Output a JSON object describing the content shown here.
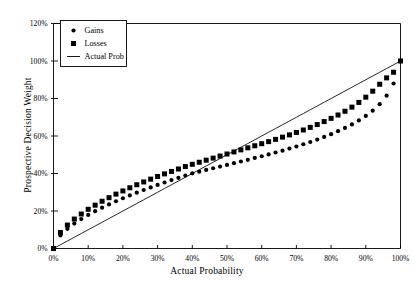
{
  "chart_data": {
    "type": "scatter",
    "title": "",
    "xlabel": "Actual Probability",
    "ylabel": "Prospective Decision Weight",
    "xlim": [
      0,
      100
    ],
    "ylim": [
      0,
      120
    ],
    "grid": false,
    "legend_position": "top-left",
    "xticks": [
      "0%",
      "10%",
      "20%",
      "30%",
      "40%",
      "50%",
      "60%",
      "70%",
      "80%",
      "90%",
      "100%"
    ],
    "xtick_values": [
      0,
      10,
      20,
      30,
      40,
      50,
      60,
      70,
      80,
      90,
      100
    ],
    "yticks": [
      "0%",
      "20%",
      "40%",
      "60%",
      "80%",
      "100%",
      "120%"
    ],
    "ytick_values": [
      0,
      20,
      40,
      60,
      80,
      100,
      120
    ],
    "x": [
      0,
      2,
      4,
      6,
      8,
      10,
      12,
      14,
      16,
      18,
      20,
      22,
      24,
      26,
      28,
      30,
      32,
      34,
      36,
      38,
      40,
      42,
      44,
      46,
      48,
      50,
      52,
      54,
      56,
      58,
      60,
      62,
      64,
      66,
      68,
      70,
      72,
      74,
      76,
      78,
      80,
      82,
      84,
      86,
      88,
      90,
      92,
      94,
      96,
      98,
      100
    ],
    "series": [
      {
        "name": "Gains",
        "marker": "circle",
        "color": "#000000",
        "values": [
          0,
          7.0,
          10.5,
          13.3,
          15.7,
          17.9,
          19.9,
          21.8,
          23.5,
          25.2,
          26.8,
          28.3,
          29.8,
          31.2,
          32.6,
          33.9,
          35.2,
          36.5,
          37.7,
          38.9,
          40.1,
          41.0,
          41.9,
          42.8,
          43.7,
          44.6,
          45.5,
          46.4,
          47.3,
          48.3,
          49.2,
          50.2,
          51.2,
          52.2,
          53.3,
          54.4,
          55.6,
          56.8,
          58.1,
          59.5,
          61.0,
          62.6,
          64.3,
          66.2,
          68.3,
          70.7,
          73.5,
          77.0,
          81.5,
          88.0,
          100
        ]
      },
      {
        "name": "Losses",
        "marker": "square",
        "color": "#000000",
        "values": [
          0,
          8.5,
          12.5,
          15.7,
          18.4,
          20.9,
          23.1,
          25.2,
          27.1,
          29.0,
          30.7,
          32.4,
          34.0,
          35.5,
          37.0,
          38.4,
          39.8,
          41.1,
          42.4,
          43.7,
          44.9,
          46.0,
          47.1,
          48.2,
          49.3,
          50.4,
          51.5,
          52.6,
          53.7,
          54.8,
          55.9,
          57.0,
          58.2,
          59.4,
          60.6,
          61.9,
          63.2,
          64.6,
          66.1,
          67.7,
          69.4,
          71.2,
          73.2,
          75.4,
          77.9,
          80.7,
          83.9,
          87.6,
          91.0,
          94.0,
          100
        ]
      },
      {
        "name": "Actual Prob",
        "marker": "line",
        "color": "#000000",
        "values": [
          0,
          2,
          4,
          6,
          8,
          10,
          12,
          14,
          16,
          18,
          20,
          22,
          24,
          26,
          28,
          30,
          32,
          34,
          36,
          38,
          40,
          42,
          44,
          46,
          48,
          50,
          52,
          54,
          56,
          58,
          60,
          62,
          64,
          66,
          68,
          70,
          72,
          74,
          76,
          78,
          80,
          82,
          84,
          86,
          88,
          90,
          92,
          94,
          96,
          98,
          100
        ]
      }
    ],
    "legend": [
      {
        "label": "Gains",
        "marker": "circle"
      },
      {
        "label": "Losses",
        "marker": "square"
      },
      {
        "label": "Actual Prob",
        "marker": "line"
      }
    ]
  }
}
